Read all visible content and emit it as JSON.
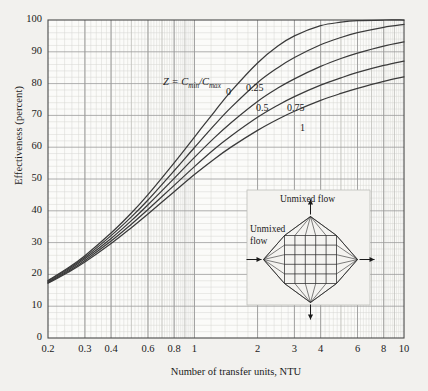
{
  "chart_data": {
    "type": "line",
    "title": "",
    "xlabel": "Number of transfer units, NTU",
    "ylabel": "Effectiveness (percent)",
    "xscale": "log",
    "yscale": "linear",
    "xlim": [
      0.2,
      10
    ],
    "ylim": [
      0,
      100
    ],
    "grid": true,
    "legend_position": "inline-curve-labels",
    "annotation": "Z = Cmin/Cmax",
    "xticks": [
      0.2,
      0.3,
      0.4,
      0.6,
      0.8,
      1,
      2,
      3,
      4,
      6,
      8,
      10
    ],
    "xtick_labels": [
      "0.2",
      "0.3",
      "0.4",
      "0.6",
      "0.8",
      "1",
      "2",
      "3",
      "4",
      "6",
      "8",
      "10"
    ],
    "yticks": [
      0,
      10,
      20,
      30,
      40,
      50,
      60,
      70,
      80,
      90,
      100
    ],
    "ytick_labels": [
      "0",
      "10",
      "20",
      "30",
      "40",
      "50",
      "60",
      "70",
      "80",
      "90",
      "100"
    ],
    "series": [
      {
        "name": "0",
        "label": "0",
        "z": 0,
        "x": [
          0.2,
          0.25,
          0.3,
          0.4,
          0.5,
          0.6,
          0.8,
          1.0,
          1.25,
          1.5,
          2.0,
          2.5,
          3.0,
          4.0,
          5.0,
          6.0,
          8.0,
          10.0
        ],
        "values": [
          18.1,
          22.1,
          25.9,
          33.0,
          39.3,
          45.1,
          55.1,
          63.2,
          71.3,
          77.7,
          86.5,
          91.8,
          95.0,
          98.2,
          99.3,
          99.8,
          100.0,
          100.0
        ]
      },
      {
        "name": "0.25",
        "label": "0.25",
        "z": 0.25,
        "x": [
          0.2,
          0.25,
          0.3,
          0.4,
          0.5,
          0.6,
          0.8,
          1.0,
          1.25,
          1.5,
          2.0,
          2.5,
          3.0,
          4.0,
          5.0,
          6.0,
          8.0,
          10.0
        ],
        "values": [
          17.9,
          21.8,
          25.4,
          32.2,
          38.1,
          43.4,
          52.6,
          59.9,
          67.1,
          72.6,
          80.3,
          85.0,
          88.2,
          92.2,
          94.5,
          96.0,
          97.7,
          98.6
        ]
      },
      {
        "name": "0.5",
        "label": "0.5",
        "z": 0.5,
        "x": [
          0.2,
          0.25,
          0.3,
          0.4,
          0.5,
          0.6,
          0.8,
          1.0,
          1.25,
          1.5,
          2.0,
          2.5,
          3.0,
          4.0,
          5.0,
          6.0,
          8.0,
          10.0
        ],
        "values": [
          17.6,
          21.4,
          24.9,
          31.3,
          36.9,
          41.9,
          50.2,
          56.8,
          63.1,
          67.8,
          74.4,
          78.6,
          81.5,
          85.4,
          87.9,
          89.6,
          91.8,
          93.1
        ]
      },
      {
        "name": "0.75",
        "label": "0.75",
        "z": 0.75,
        "x": [
          0.2,
          0.25,
          0.3,
          0.4,
          0.5,
          0.6,
          0.8,
          1.0,
          1.25,
          1.5,
          2.0,
          2.5,
          3.0,
          4.0,
          5.0,
          6.0,
          8.0,
          10.0
        ],
        "values": [
          17.4,
          21.0,
          24.4,
          30.5,
          35.8,
          40.4,
          48.0,
          53.9,
          59.5,
          63.6,
          69.4,
          73.2,
          75.9,
          79.5,
          81.8,
          83.5,
          85.7,
          87.1
        ]
      },
      {
        "name": "1",
        "label": "1",
        "z": 1,
        "x": [
          0.2,
          0.25,
          0.3,
          0.4,
          0.5,
          0.6,
          0.8,
          1.0,
          1.25,
          1.5,
          2.0,
          2.5,
          3.0,
          4.0,
          5.0,
          6.0,
          8.0,
          10.0
        ],
        "values": [
          17.2,
          20.7,
          23.9,
          29.7,
          34.7,
          39.0,
          46.0,
          51.4,
          56.4,
          60.1,
          65.3,
          68.8,
          71.3,
          74.7,
          76.9,
          78.5,
          80.7,
          82.1
        ]
      }
    ]
  },
  "axes": {
    "ylabel": "Effectiveness (percent)",
    "xlabel": "Number of transfer units, NTU"
  },
  "annotations": {
    "z_legend_prefix": "Z = C",
    "z_legend_sub1": "min",
    "z_legend_mid": "/C",
    "z_legend_sub2": "max"
  },
  "inset": {
    "top_label": "Unmixed flow",
    "left_label_line1": "Unmixed",
    "left_label_line2": "flow",
    "diagram_name": "cross-flow-both-unmixed"
  },
  "colors": {
    "page_background": "#f2f1ee",
    "plot_background": "#fbfbf9",
    "curve": "#3a3a3a",
    "grid_major": "#9a9a9a",
    "grid_minor": "#d6d6d2",
    "axis": "#4a4a4a",
    "text": "#1a1a1a"
  }
}
